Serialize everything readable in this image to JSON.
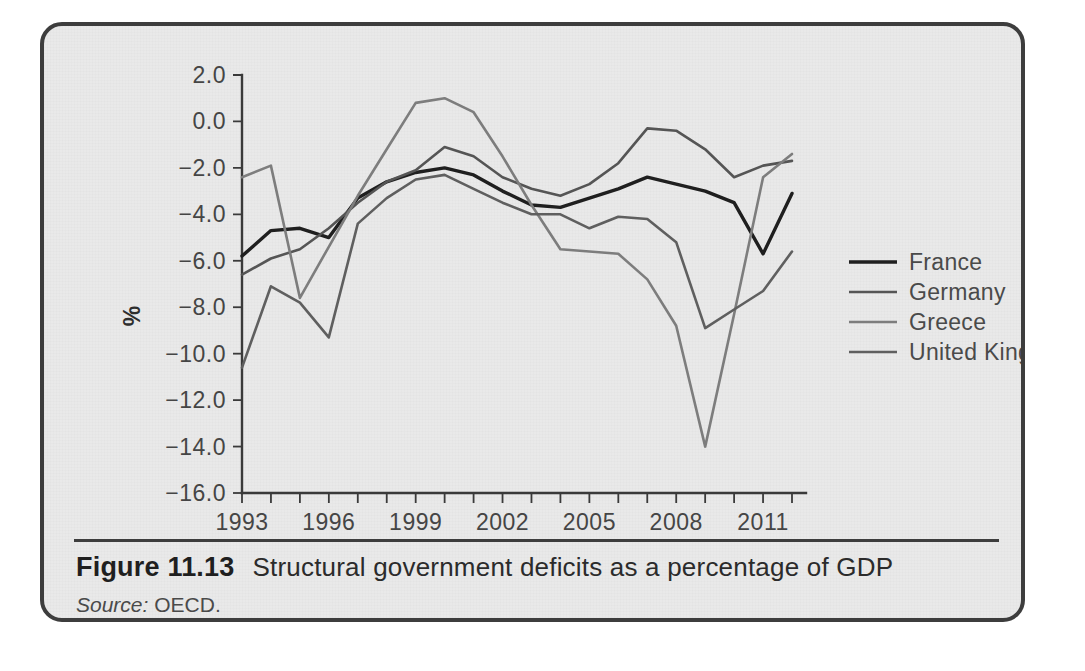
{
  "figure": {
    "number": "Figure 11.13",
    "title": "Structural government deficits as a percentage of GDP",
    "source_label": "Source:",
    "source_value": " OECD."
  },
  "chart_data": {
    "type": "line",
    "title": "Structural government deficits as a percentage of GDP",
    "xlabel": "",
    "ylabel": "%",
    "xlim": [
      1993,
      2012
    ],
    "ylim": [
      -16.0,
      2.0
    ],
    "grid": false,
    "legend_position": "right",
    "x": [
      1993,
      1994,
      1995,
      1996,
      1997,
      1998,
      1999,
      2000,
      2001,
      2002,
      2003,
      2004,
      2005,
      2006,
      2007,
      2008,
      2009,
      2010,
      2011,
      2012
    ],
    "x_tick_labels": [
      "1993",
      "1996",
      "1999",
      "2002",
      "2005",
      "2008",
      "2011"
    ],
    "x_tick_values": [
      1993,
      1996,
      1999,
      2002,
      2005,
      2008,
      2011
    ],
    "y_tick_labels": [
      "2.0",
      "0.0",
      "-2.0",
      "-4.0",
      "-6.0",
      "-8.0",
      "-10.0",
      "-12.0",
      "-14.0",
      "-16.0"
    ],
    "y_tick_values": [
      2.0,
      0.0,
      -2.0,
      -4.0,
      -6.0,
      -8.0,
      -10.0,
      -12.0,
      -14.0,
      -16.0
    ],
    "series": [
      {
        "name": "France",
        "color": "#1f1f1f",
        "width": 3.4,
        "values": [
          -5.8,
          -4.7,
          -4.6,
          -5.0,
          -3.3,
          -2.6,
          -2.2,
          -2.0,
          -2.3,
          -3.0,
          -3.6,
          -3.7,
          -3.3,
          -2.9,
          -2.4,
          -2.7,
          -3.0,
          -3.5,
          -5.7,
          -3.1
        ]
      },
      {
        "name": "Germany",
        "color": "#555555",
        "width": 2.6,
        "values": [
          -6.6,
          -5.9,
          -5.5,
          -4.6,
          -3.5,
          -2.6,
          -2.1,
          -1.1,
          -1.5,
          -2.4,
          -2.9,
          -3.2,
          -2.7,
          -1.8,
          -0.3,
          -0.4,
          -1.2,
          -2.4,
          -1.9,
          -1.7
        ]
      },
      {
        "name": "Greece",
        "color": "#7d7d7d",
        "width": 2.6,
        "values": [
          -2.4,
          -1.9,
          -7.6,
          -5.4,
          -3.2,
          -1.2,
          0.8,
          1.0,
          0.4,
          -1.5,
          -3.6,
          -5.5,
          -5.6,
          -5.7,
          -6.8,
          -8.8,
          -14.0,
          -8.3,
          -2.4,
          -1.4
        ]
      },
      {
        "name": "United Kingdom",
        "color": "#5f5f5f",
        "width": 2.6,
        "values": [
          -10.6,
          -7.1,
          -7.8,
          -9.3,
          -4.4,
          -3.3,
          -2.5,
          -2.3,
          -2.9,
          -3.5,
          -4.0,
          -4.0,
          -4.6,
          -4.1,
          -4.2,
          -5.2,
          -8.9,
          -8.1,
          -7.3,
          -5.6
        ]
      }
    ]
  },
  "legend": {
    "items": [
      {
        "label": "France"
      },
      {
        "label": "Germany"
      },
      {
        "label": "Greece"
      },
      {
        "label": "United Kingdom"
      }
    ]
  }
}
